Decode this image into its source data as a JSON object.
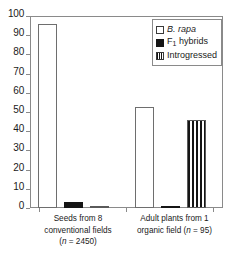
{
  "chart_data": {
    "type": "bar",
    "title": "",
    "xlabel": "",
    "ylabel": "",
    "ylim": [
      0,
      100
    ],
    "yticks": [
      0,
      10,
      20,
      30,
      40,
      50,
      60,
      70,
      80,
      90,
      100
    ],
    "ytick_labels": [
      "0",
      "10",
      "20",
      "30",
      "40",
      "50",
      "60",
      "70",
      "80",
      "90",
      "100"
    ],
    "grid": false,
    "legend_position": "top-right",
    "categories": [
      "Seeds from 8 conventional fields (n = 2450)",
      "Adult plants from 1 organic field (n = 95)"
    ],
    "category_lines": [
      [
        "Seeds from 8",
        "conventional fields",
        "(n = 2450)"
      ],
      [
        "Adult plants from 1",
        "organic field (n = 95)"
      ]
    ],
    "series": [
      {
        "name": "B. rapa",
        "style": "open",
        "values": [
          96,
          52.5
        ]
      },
      {
        "name": "F1 hybrids",
        "style": "solid",
        "values": [
          3,
          1
        ]
      },
      {
        "name": "Introgressed",
        "style": "striped",
        "values": [
          1,
          46
        ]
      }
    ]
  },
  "axis": {
    "y_ticks": [
      {
        "value": 100,
        "label": "100"
      },
      {
        "value": 90,
        "label": "90"
      },
      {
        "value": 80,
        "label": "80"
      },
      {
        "value": 70,
        "label": "70"
      },
      {
        "value": 60,
        "label": "60"
      },
      {
        "value": 50,
        "label": "50"
      },
      {
        "value": 40,
        "label": "40"
      },
      {
        "value": 30,
        "label": "30"
      },
      {
        "value": 20,
        "label": "20"
      },
      {
        "value": 10,
        "label": "10"
      },
      {
        "value": 0,
        "label": "0"
      }
    ]
  },
  "legend": {
    "entries": [
      {
        "swatch": "open-square-swatch",
        "label": "B. rapa",
        "italic": true,
        "subscript": ""
      },
      {
        "swatch": "filled-square-swatch",
        "label": "F",
        "italic": false,
        "subscript": "1",
        "suffix": " hybrids"
      },
      {
        "swatch": "striped-square-swatch",
        "label": "Introgressed",
        "italic": false,
        "subscript": ""
      }
    ]
  },
  "x_labels": {
    "group1": {
      "line1": "Seeds from 8",
      "line2": "conventional fields",
      "line3_prefix": "(",
      "line3_italic": "n",
      "line3_suffix": " = 2450)"
    },
    "group2": {
      "line1": "Adult plants from 1",
      "line2_prefix": "organic field (",
      "line2_italic": "n",
      "line2_suffix": " = 95)"
    }
  }
}
